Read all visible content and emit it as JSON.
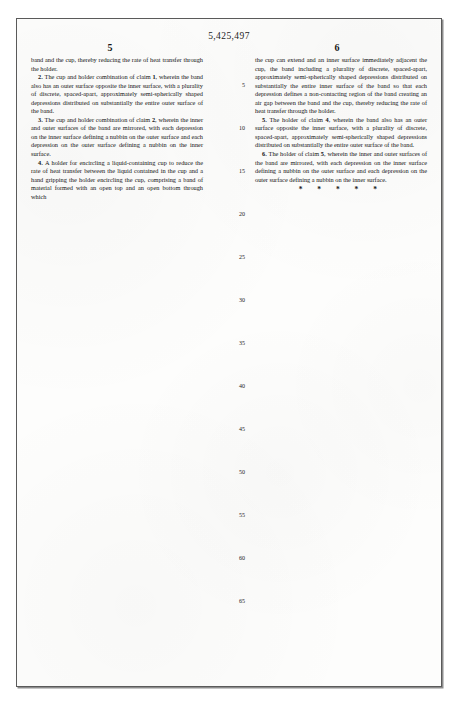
{
  "document": {
    "type": "us-patent-claims-page",
    "patent_number": "5,425,497",
    "column_left_number": "5",
    "column_right_number": "6",
    "end_of_claims_mark": "*  *  *  *  *"
  },
  "columns": {
    "left": {
      "paragraphs": [
        {
          "id": "claim-1-continuation",
          "indent": false,
          "text": "band and the cup, thereby reducing the rate of heat transfer through the holder."
        },
        {
          "id": "claim-2",
          "indent": true,
          "number": "2.",
          "text": "The cup and holder combination of claim 1, wherein the band also has an outer surface opposite the inner surface, with a plurality of discrete, spaced-apart, approximately semi-spherically shaped depressions distributed on substantially the entire outer surface of the band."
        },
        {
          "id": "claim-3",
          "indent": true,
          "number": "3.",
          "text": "The cup and holder combination of claim 2, wherein the inner and outer surfaces of the band are mirrored, with each depression on the inner surface defining a nubbin on the outer surface and each depression on the outer surface defining a nubbin on the inner surface."
        },
        {
          "id": "claim-4",
          "indent": true,
          "number": "4.",
          "text": "A holder for encircling a liquid-containing cup to reduce the rate of heat transfer between the liquid contained in the cup and a hand gripping the holder encircling the cup, comprising a band of material formed with an open top and an open bottom through which"
        }
      ]
    },
    "right": {
      "paragraphs": [
        {
          "id": "claim-4-continuation",
          "indent": false,
          "text": "the cup can extend and an inner surface immediately adjacent the cup, the band including a plurality of discrete, spaced-apart, approximately semi-spherically shaped depressions distributed on substantially the entire inner surface of the band so that each depression defines a non-contacting region of the band creating an air gap between the band and the cup, thereby reducing the rate of heat transfer through the holder."
        },
        {
          "id": "claim-5",
          "indent": true,
          "number": "5.",
          "text": "The holder of claim 4, wherein the band also has an outer surface opposite the inner surface, with a plurality of discrete, spaced-apart, approximately semi-spherically shaped depressions distributed on substantially the entire outer surface of the band."
        },
        {
          "id": "claim-6",
          "indent": true,
          "number": "6.",
          "text": "The holder of claim 5, wherein the inner and outer surfaces of the band are mirrored, with each depression on the inner surface defining a nubbin on the outer surface and each depression on the outer surface defining a nubbin on the inner surface."
        }
      ]
    }
  },
  "line_numbers": [
    {
      "label": "5",
      "top": 26
    },
    {
      "label": "10",
      "top": 69
    },
    {
      "label": "15",
      "top": 112
    },
    {
      "label": "20",
      "top": 155
    },
    {
      "label": "25",
      "top": 198
    },
    {
      "label": "30",
      "top": 241
    },
    {
      "label": "35",
      "top": 284
    },
    {
      "label": "40",
      "top": 327
    },
    {
      "label": "45",
      "top": 370
    },
    {
      "label": "50",
      "top": 413
    },
    {
      "label": "55",
      "top": 456
    },
    {
      "label": "60",
      "top": 499
    },
    {
      "label": "65",
      "top": 542
    }
  ]
}
